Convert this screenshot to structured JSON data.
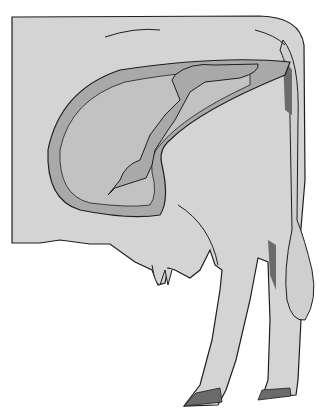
{
  "figure": {
    "colors": {
      "background": "#ffffff",
      "body": "#d4d4d4",
      "uterus": "#a9a9a9",
      "fluid": "#c2c2c2",
      "dark": "#6b6b6b",
      "outline": "#1e1e1e"
    }
  }
}
